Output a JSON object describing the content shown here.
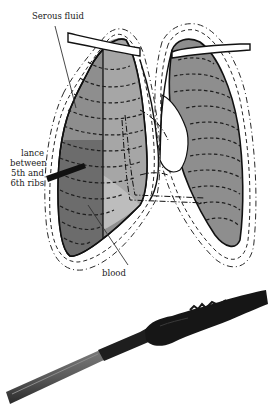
{
  "figure": {
    "labels": {
      "serous_fluid": "Serous fluid",
      "lance_lines": [
        "lance",
        "between",
        "5th and",
        "6th ribs"
      ],
      "blood": "blood"
    },
    "colors": {
      "lung_fill": "#8a8a8a",
      "lung_fill_light": "#a8a8a8",
      "blood_fill": "#6a6a6a",
      "outline": "#111111",
      "dash": "#2a2a2a",
      "lance_dark": "#1c1c1c",
      "lance_shaft": "#5a5a5a"
    }
  }
}
